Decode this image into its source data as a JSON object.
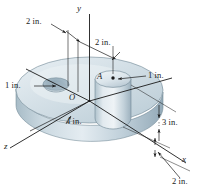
{
  "figure": {
    "caption_labels": {
      "dim_hole_offset_z": "2 in.",
      "dim_cyl_offset_x": "2 in.",
      "dim_hole_radius": "1 in.",
      "dim_cyl_radius": "1 in.",
      "dim_disk_radius": "4 in.",
      "dim_cyl_height": "3 in.",
      "dim_disk_thickness": "2 in."
    },
    "axis_labels": {
      "y": "y",
      "x": "x",
      "z": "z"
    },
    "point_labels": {
      "origin": "O",
      "point_a": "A"
    },
    "colors": {
      "background": "#ffffff",
      "line": "#1a1a1a",
      "body_light": "#e8eef2",
      "body_mid": "#c3d2da",
      "body_dark": "#9fb3bf",
      "hole_shadow": "#8fa5b3",
      "text": "#1a1a1a"
    }
  }
}
